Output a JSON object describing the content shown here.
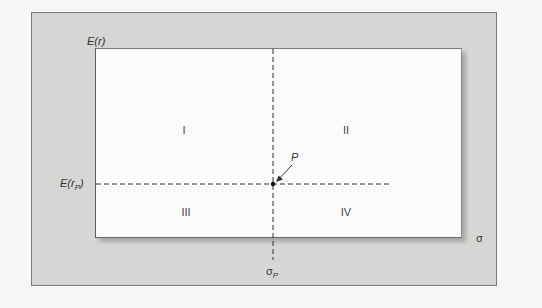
{
  "diagram": {
    "y_axis_label": "E(r)",
    "x_axis_label": "σ",
    "y_point_label": {
      "main": "E(r",
      "sub": "P",
      "close": ")"
    },
    "x_point_label": {
      "main": "σ",
      "sub": "P"
    },
    "point_label": "P",
    "quadrants": [
      {
        "id": "I",
        "label": "I"
      },
      {
        "id": "II",
        "label": "II"
      },
      {
        "id": "III",
        "label": "III"
      },
      {
        "id": "IV",
        "label": "IV"
      }
    ],
    "colors": {
      "outer_panel": "#d6d6d4",
      "plot_area": "#fbfbfb",
      "lines": "#333333",
      "background": "#f7f7f5"
    }
  }
}
